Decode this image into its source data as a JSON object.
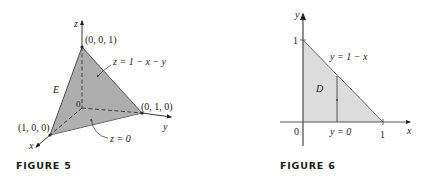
{
  "figure5": {
    "caption": "FIGURE 5",
    "axis_z": "z",
    "axis_y": "y",
    "axis_x": "x",
    "origin": "0",
    "point_top": "(0, 0, 1)",
    "point_right": "(0, 1, 0)",
    "point_left": "(1, 0, 0)",
    "region": "E",
    "top_surface": "z = 1 − x − y",
    "bottom_surface": "z = 0",
    "colors": {
      "solid": "#a9a9a9",
      "edge": "#333333"
    }
  },
  "figure6": {
    "caption": "FIGURE 6",
    "axis_y": "y",
    "axis_x": "x",
    "origin": "0",
    "tick_y": "1",
    "tick_x": "1",
    "region": "D",
    "upper_boundary": "y = 1 − x",
    "lower_boundary": "y = 0",
    "colors": {
      "region": "#d9d9d9",
      "edge": "#555555"
    }
  }
}
